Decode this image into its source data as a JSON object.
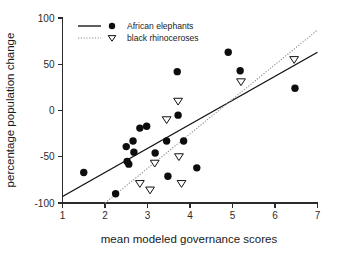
{
  "chart_data": {
    "type": "scatter",
    "title": "",
    "xlabel": "mean modeled governance scores",
    "ylabel": "percentage population change",
    "xlim": [
      1,
      7
    ],
    "ylim": [
      -100,
      100
    ],
    "xticks": [
      1,
      2,
      3,
      4,
      5,
      6,
      7
    ],
    "yticks": [
      -100,
      -50,
      0,
      50,
      100
    ],
    "xtick_labels": [
      "1",
      "2",
      "3",
      "4",
      "5",
      "6",
      "7"
    ],
    "ytick_labels": [
      "-100",
      "-50",
      "0",
      "50",
      "100"
    ],
    "grid": false,
    "legend_position": "top-left",
    "series": [
      {
        "name": "African elephants",
        "marker": "filled-circle",
        "line_style": "solid",
        "points": [
          {
            "x": 1.5,
            "y": -67
          },
          {
            "x": 2.25,
            "y": -90
          },
          {
            "x": 2.5,
            "y": -39
          },
          {
            "x": 2.52,
            "y": -55
          },
          {
            "x": 2.56,
            "y": -58
          },
          {
            "x": 2.66,
            "y": -33
          },
          {
            "x": 2.68,
            "y": -45
          },
          {
            "x": 2.82,
            "y": -19
          },
          {
            "x": 2.98,
            "y": -17
          },
          {
            "x": 3.18,
            "y": -46
          },
          {
            "x": 3.45,
            "y": -33
          },
          {
            "x": 3.48,
            "y": -71
          },
          {
            "x": 3.7,
            "y": 42
          },
          {
            "x": 3.72,
            "y": -5
          },
          {
            "x": 3.85,
            "y": -33
          },
          {
            "x": 4.16,
            "y": -62
          },
          {
            "x": 4.9,
            "y": 63
          },
          {
            "x": 5.18,
            "y": 43
          },
          {
            "x": 6.47,
            "y": 24
          }
        ],
        "fit_line": {
          "x1": 1.0,
          "y1": -93,
          "x2": 7.0,
          "y2": 63
        }
      },
      {
        "name": "black rhinoceroses",
        "marker": "open-down-triangle",
        "line_style": "dotted",
        "points": [
          {
            "x": 2.82,
            "y": -79
          },
          {
            "x": 3.06,
            "y": -86
          },
          {
            "x": 3.17,
            "y": -57
          },
          {
            "x": 3.45,
            "y": -10
          },
          {
            "x": 3.72,
            "y": 10
          },
          {
            "x": 3.74,
            "y": -50
          },
          {
            "x": 3.8,
            "y": -79
          },
          {
            "x": 5.2,
            "y": 31
          },
          {
            "x": 6.45,
            "y": 55
          }
        ],
        "fit_line": {
          "x1": 2.0,
          "y1": -100,
          "x2": 7.0,
          "y2": 87
        }
      }
    ]
  },
  "legend": {
    "entries": [
      {
        "label": "African elephants",
        "line_style": "solid",
        "marker": "filled-circle"
      },
      {
        "label": "black rhinoceroses",
        "line_style": "dotted",
        "marker": "open-down-triangle"
      }
    ]
  },
  "colors": {
    "marker_fill": "#0d0d0d",
    "axis": "#2b2b2b",
    "fit_solid": "#111111",
    "fit_dotted": "#8c8c8c",
    "background": "#ffffff"
  }
}
